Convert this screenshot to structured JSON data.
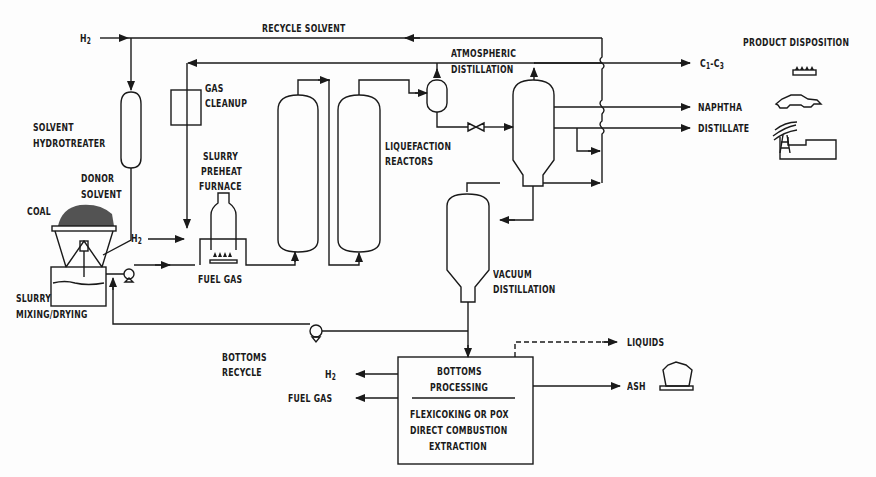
{
  "streams": {
    "h2_feed": "H2",
    "recycle_solvent": "RECYCLE SOLVENT",
    "h2_slurry": "H2",
    "fuel_gas_furnace": "FUEL GAS",
    "bottoms_recycle_line1": "BOTTOMS",
    "bottoms_recycle_line2": "RECYCLE",
    "c1_c3": "C1-C3",
    "naphtha": "NAPHTHA",
    "distillate": "DISTILLATE",
    "h2_out": "H2",
    "fuel_gas_out": "FUEL GAS",
    "liquids": "LIQUIDS",
    "ash": "ASH"
  },
  "units": {
    "solvent_hydrotreater_line1": "SOLVENT",
    "solvent_hydrotreater_line2": "HYDROTREATER",
    "gas_cleanup_line1": "GAS",
    "gas_cleanup_line2": "CLEANUP",
    "donor_solvent_line1": "DONOR",
    "donor_solvent_line2": "SOLVENT",
    "coal": "COAL",
    "slurry_mixing_line1": "SLURRY",
    "slurry_mixing_line2": "MIXING/DRYING",
    "furnace_line1": "SLURRY",
    "furnace_line2": "PREHEAT",
    "furnace_line3": "FURNACE",
    "liquefaction_line1": "LIQUEFACTION",
    "liquefaction_line2": "REACTORS",
    "atm_dist_line1": "ATMOSPHERIC",
    "atm_dist_line2": "DISTILLATION",
    "vac_dist_line1": "VACUUM",
    "vac_dist_line2": "DISTILLATION",
    "bottoms_box_title1": "BOTTOMS",
    "bottoms_box_title2": "PROCESSING",
    "bottoms_box_opt1": "FLEXICOKING OR POX",
    "bottoms_box_opt2": "DIRECT COMBUSTION",
    "bottoms_box_opt3": "EXTRACTION"
  },
  "product_disposition": {
    "heading": "PRODUCT DISPOSITION",
    "icons": [
      "gas-burner-icon",
      "car-icon",
      "power-plant-icon",
      "ash-cart-icon"
    ]
  },
  "colors": {
    "line": "#1a1a1a",
    "background": "#fdfdfd"
  }
}
